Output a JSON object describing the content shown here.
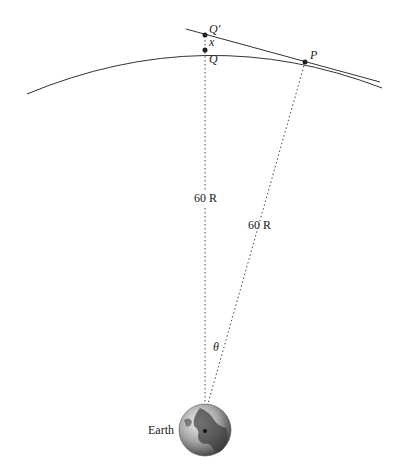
{
  "labels": {
    "q_prime": "Q′",
    "x": "x",
    "q": "Q",
    "p": "P",
    "radius_vertical": "60 R",
    "radius_slanted": "60 R",
    "theta": "θ",
    "earth": "Earth"
  },
  "colors": {
    "line": "#333333",
    "dotted": "#444444",
    "globe_light": "#e0e0e0",
    "globe_dark": "#333333"
  }
}
